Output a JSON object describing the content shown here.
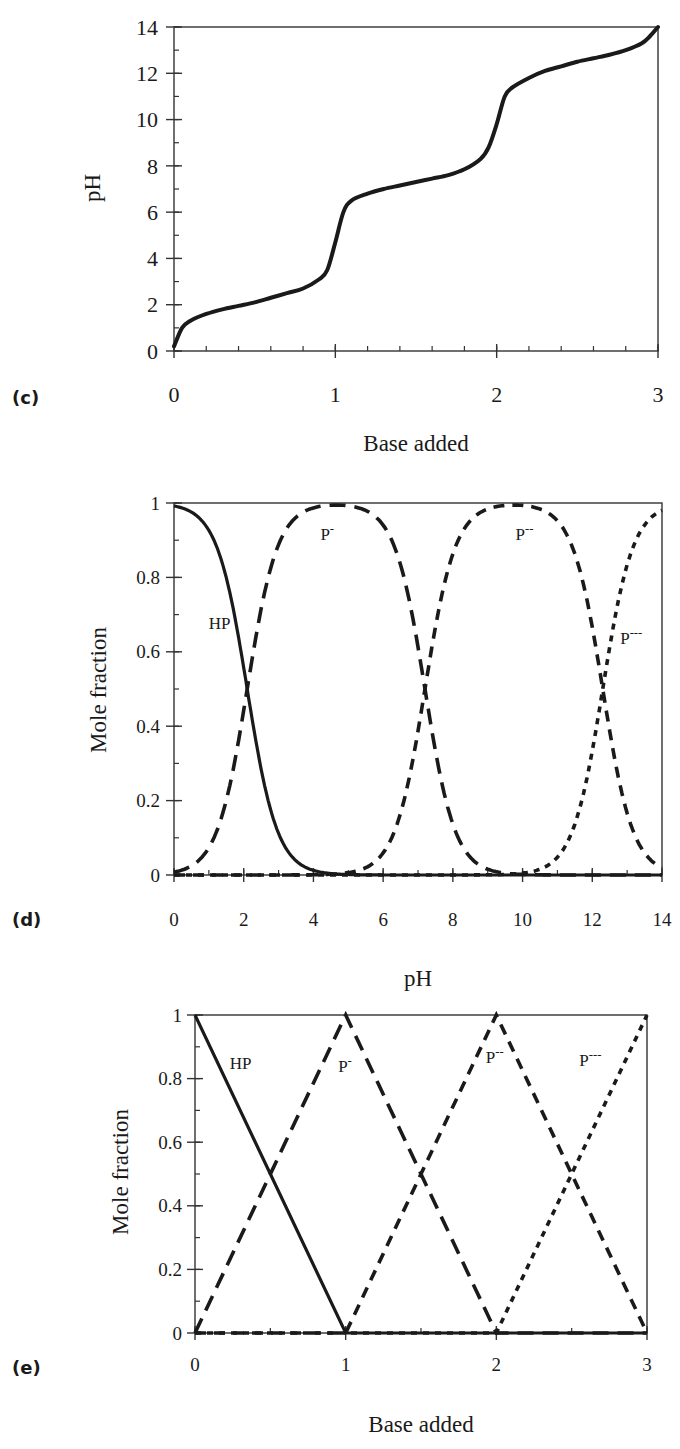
{
  "chart_data": [
    {
      "panel_label": "(c)",
      "type": "line",
      "title": "",
      "xlabel": "Base added",
      "ylabel": "pH",
      "xlim": [
        0,
        3
      ],
      "ylim": [
        0,
        14
      ],
      "xticks": [
        0,
        1,
        2,
        3
      ],
      "yticks": [
        0,
        2,
        4,
        6,
        8,
        10,
        12,
        14
      ],
      "x_minor_step": 0.2,
      "y_minor_step": 1,
      "grid": false,
      "pKa": [
        2.1,
        7.2,
        12.3
      ],
      "series": [
        {
          "name": "pH",
          "style": "solid",
          "x": [
            0,
            0.05,
            0.1,
            0.2,
            0.3,
            0.4,
            0.5,
            0.6,
            0.7,
            0.8,
            0.9,
            0.95,
            1.0,
            1.05,
            1.1,
            1.2,
            1.3,
            1.4,
            1.5,
            1.6,
            1.7,
            1.8,
            1.9,
            1.95,
            2.0,
            2.05,
            2.1,
            2.2,
            2.3,
            2.4,
            2.5,
            2.6,
            2.7,
            2.8,
            2.9,
            2.95,
            3.0
          ],
          "y": [
            0.2,
            1.0,
            1.3,
            1.6,
            1.8,
            1.95,
            2.1,
            2.3,
            2.5,
            2.7,
            3.1,
            3.5,
            4.7,
            6.0,
            6.5,
            6.8,
            7.0,
            7.15,
            7.3,
            7.45,
            7.6,
            7.85,
            8.3,
            8.8,
            9.8,
            11.0,
            11.4,
            11.8,
            12.1,
            12.3,
            12.5,
            12.65,
            12.8,
            13.0,
            13.3,
            13.6,
            14.0
          ]
        }
      ]
    },
    {
      "panel_label": "(d)",
      "type": "line",
      "title": "",
      "xlabel": "pH",
      "ylabel": "Mole fraction",
      "xlim": [
        0,
        14
      ],
      "ylim": [
        0,
        1
      ],
      "xticks": [
        0,
        2,
        4,
        6,
        8,
        10,
        12,
        14
      ],
      "yticks": [
        0,
        0.2,
        0.4,
        0.6,
        0.8,
        1
      ],
      "ytick_labels": [
        "0",
        "0.2",
        "0.4",
        "0.6",
        "0.8",
        "1"
      ],
      "x_minor_step": 1,
      "y_minor_step": 0.1,
      "grid": false,
      "pKa": [
        2.1,
        7.2,
        12.3
      ],
      "series": [
        {
          "name": "HP",
          "style": "solid",
          "label_pos": [
            1.0,
            0.66
          ]
        },
        {
          "name": "P-",
          "style": "long-dash",
          "label_pos": [
            4.2,
            0.9
          ]
        },
        {
          "name": "P--",
          "style": "medium-dash",
          "label_pos": [
            9.8,
            0.9
          ]
        },
        {
          "name": "P---",
          "style": "short-dash",
          "label_pos": [
            12.8,
            0.62
          ]
        }
      ],
      "series_labels": [
        "HP",
        "P",
        "P",
        "P"
      ],
      "series_superscripts": [
        "",
        "-",
        "--",
        "---"
      ]
    },
    {
      "panel_label": "(e)",
      "type": "line",
      "title": "",
      "xlabel": "Base added",
      "ylabel": "Mole fraction",
      "xlim": [
        0,
        3
      ],
      "ylim": [
        0,
        1
      ],
      "xticks": [
        0,
        1,
        2,
        3
      ],
      "yticks": [
        0,
        0.2,
        0.4,
        0.6,
        0.8,
        1
      ],
      "ytick_labels": [
        "0",
        "0.2",
        "0.4",
        "0.6",
        "0.8",
        "1"
      ],
      "x_minor_step": 0.5,
      "y_minor_step": 0.1,
      "grid": false,
      "series": [
        {
          "name": "HP",
          "style": "solid",
          "x": [
            0,
            1,
            3
          ],
          "y": [
            1,
            0,
            0
          ],
          "label_pos": [
            0.23,
            0.83
          ]
        },
        {
          "name": "P-",
          "style": "long-dash",
          "x": [
            0,
            1,
            2,
            3
          ],
          "y": [
            0,
            1,
            0,
            0
          ],
          "label_pos": [
            0.95,
            0.82
          ]
        },
        {
          "name": "P--",
          "style": "medium-dash",
          "x": [
            0,
            1,
            2,
            3
          ],
          "y": [
            0,
            0,
            1,
            0
          ],
          "label_pos": [
            1.93,
            0.85
          ]
        },
        {
          "name": "P---",
          "style": "short-dash",
          "x": [
            0,
            2,
            3
          ],
          "y": [
            0,
            0,
            1
          ],
          "label_pos": [
            2.55,
            0.84
          ]
        }
      ],
      "series_labels": [
        "HP",
        "P",
        "P",
        "P"
      ],
      "series_superscripts": [
        "",
        "-",
        "--",
        "---"
      ]
    }
  ]
}
